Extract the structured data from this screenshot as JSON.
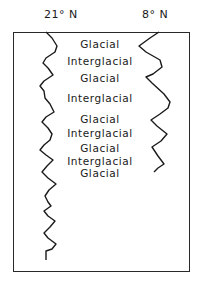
{
  "columns": {
    "left_label": "21° N",
    "right_label": "8° N"
  },
  "stages": [
    {
      "label": "Glacial",
      "y": 44
    },
    {
      "label": "Interglacial",
      "y": 61
    },
    {
      "label": "Glacial",
      "y": 78
    },
    {
      "label": "Interglacial",
      "y": 98
    },
    {
      "label": "Glacial",
      "y": 119
    },
    {
      "label": "Interglacial",
      "y": 133
    },
    {
      "label": "Glacial",
      "y": 148
    },
    {
      "label": "Interglacial",
      "y": 161
    },
    {
      "label": "Glacial",
      "y": 173
    }
  ],
  "curves": {
    "left": {
      "name": "21N-record",
      "color": "#1a1a1a"
    },
    "right": {
      "name": "8N-record",
      "color": "#1a1a1a"
    }
  }
}
